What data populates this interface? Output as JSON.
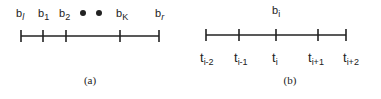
{
  "panel_a": {
    "caption": "(a)",
    "labels": [
      {
        "base": "b",
        "sub": "l"
      },
      {
        "base": "b",
        "sub": "1"
      },
      {
        "base": "b",
        "sub": "2"
      },
      {
        "base": "b",
        "sub": "K"
      },
      {
        "base": "b",
        "sub": "r"
      }
    ],
    "ellipsis": "• •"
  },
  "panel_b": {
    "caption": "(b)",
    "top_label": {
      "base": "b",
      "sub": "i"
    },
    "labels": [
      {
        "base": "t",
        "sub": "i-2"
      },
      {
        "base": "t",
        "sub": "i-1"
      },
      {
        "base": "t",
        "sub": "i"
      },
      {
        "base": "t",
        "sub": "i+1"
      },
      {
        "base": "t",
        "sub": "i+2"
      }
    ]
  },
  "colors": {
    "stroke": "#222222"
  }
}
